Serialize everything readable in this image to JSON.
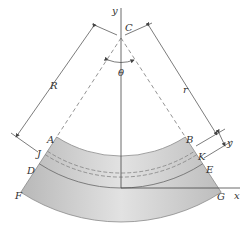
{
  "figure": {
    "type": "curved-beam bending diagram",
    "labels": {
      "y_axis": "y",
      "x_axis": "x",
      "center": "C",
      "angle": "θ",
      "radius_neutral": "R",
      "radius_general": "r",
      "offset": "y",
      "point_A": "A",
      "point_B": "B",
      "point_J": "J",
      "point_K": "K",
      "point_D": "D",
      "point_E": "E",
      "point_F": "F",
      "point_G": "G"
    },
    "colors": {
      "beam_fill": "#c8c8c8",
      "beam_edge": "#8a8a8a",
      "line": "#444444",
      "dashed": "#777777"
    }
  }
}
